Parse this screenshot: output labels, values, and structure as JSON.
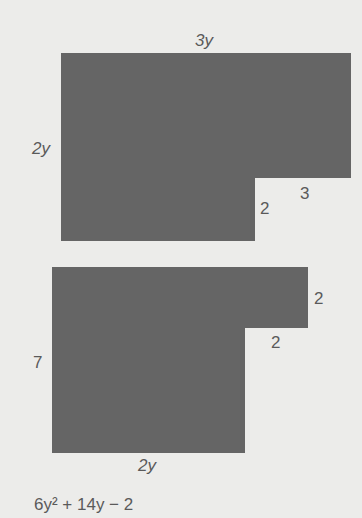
{
  "figure1": {
    "labels": {
      "top": "3y",
      "left": "2y",
      "notch_horizontal": "3",
      "notch_vertical": "2"
    }
  },
  "figure2": {
    "labels": {
      "right": "2",
      "notch_horizontal": "2",
      "left": "7",
      "bottom": "2y"
    }
  },
  "answer": {
    "text": "6y² + 14y − 2"
  },
  "colors": {
    "shape_fill": "#656565",
    "background": "#ececea",
    "text": "#5a5a5a"
  }
}
